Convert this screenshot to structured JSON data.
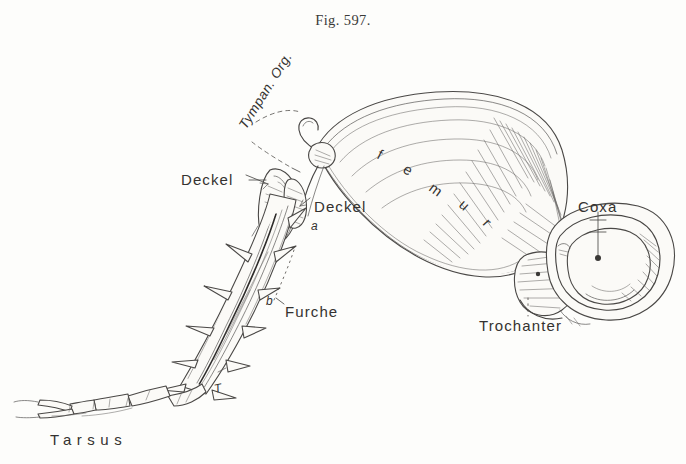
{
  "figure": {
    "caption": "Fig. 597.",
    "background_color": "#fdfdfb",
    "ink_color": "#4a4846",
    "text_color": "#343230"
  },
  "labels": {
    "tympan_org": "Tympan. Org.",
    "deckel_left": "Deckel",
    "deckel_right": "Deckel",
    "furche": "Furche",
    "femur_letters": [
      "f",
      "e",
      "m",
      "u",
      "r"
    ],
    "femur": "femur",
    "coxa": "Coxa",
    "trochanter": "Trochanter",
    "tarsus": "Tarsus",
    "mark_a": "a",
    "mark_b": "b",
    "mark_t": "T"
  },
  "annotations": {
    "deckel_left_dash": "—",
    "leader_style_coxa": "solid-vertical-with-ticks",
    "leader_style_trochanter": "dotted-vertical",
    "leader_style_tympan": "dashed-diagonal"
  }
}
